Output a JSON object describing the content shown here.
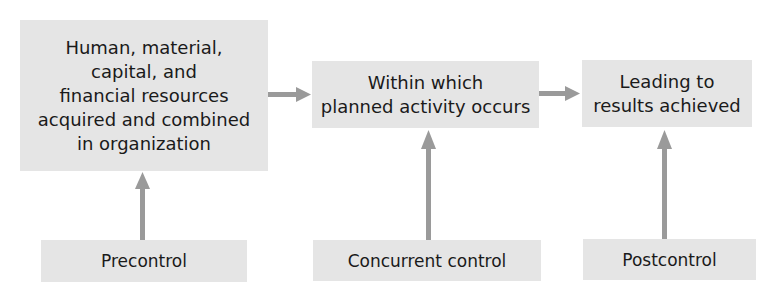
{
  "diagram": {
    "stages": [
      {
        "id": "resources",
        "label": "Human, material,\ncapital, and\nfinancial resources\nacquired and combined\nin organization"
      },
      {
        "id": "activity",
        "label": "Within which\nplanned activity occurs"
      },
      {
        "id": "results",
        "label": "Leading to\nresults achieved"
      }
    ],
    "controls": [
      {
        "id": "precontrol",
        "label": "Precontrol",
        "targets": "resources"
      },
      {
        "id": "concurrent",
        "label": "Concurrent control",
        "targets": "activity"
      },
      {
        "id": "postcontrol",
        "label": "Postcontrol",
        "targets": "results"
      }
    ],
    "flow": [
      {
        "from": "resources",
        "to": "activity"
      },
      {
        "from": "activity",
        "to": "results"
      }
    ],
    "colors": {
      "box_fill": "#e5e5e5",
      "arrow": "#9a9a9a",
      "text": "#1a1a1a"
    }
  }
}
